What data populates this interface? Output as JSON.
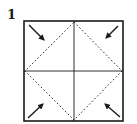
{
  "step": {
    "number": "1"
  },
  "diagram": {
    "colors": {
      "line": "#1a1a1a",
      "background": "#ffffff"
    },
    "square": {
      "x": 24,
      "y": 21,
      "size": 99
    },
    "creases": [
      "vertical-center",
      "horizontal-center"
    ],
    "fold_lines": "dashed-diamond",
    "arrows": [
      "top-left-inward",
      "top-right-inward",
      "bottom-left-inward",
      "bottom-right-inward"
    ]
  }
}
